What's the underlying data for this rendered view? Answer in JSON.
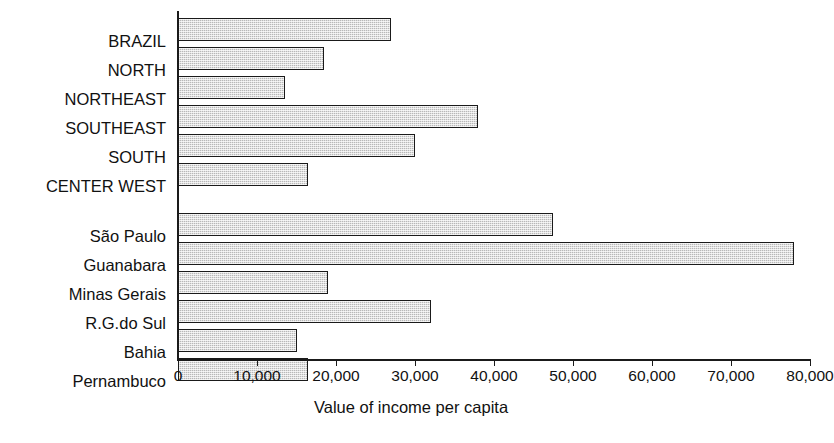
{
  "chart_data": {
    "type": "bar",
    "orientation": "horizontal",
    "title": "",
    "xlabel": "Value of income per capita",
    "ylabel": "",
    "xlim": [
      0,
      80000
    ],
    "grid": false,
    "legend": null,
    "xticks": [
      0,
      10000,
      20000,
      30000,
      40000,
      50000,
      60000,
      70000,
      80000
    ],
    "xticklabels": [
      "0",
      "10,000",
      "20,000",
      "30,000",
      "40,000",
      "50,000",
      "60,000",
      "70,000",
      "80,000"
    ],
    "groups": [
      {
        "name": "regions",
        "categories": [
          "BRAZIL",
          "NORTH",
          "NORTHEAST",
          "SOUTHEAST",
          "SOUTH",
          "CENTER WEST"
        ],
        "values": [
          27000,
          18500,
          13500,
          38000,
          30000,
          16500
        ]
      },
      {
        "name": "states",
        "categories": [
          "São Paulo",
          "Guanabara",
          "Minas Gerais",
          "R.G.do Sul",
          "Bahia",
          "Pernambuco"
        ],
        "values": [
          47500,
          78000,
          19000,
          32000,
          15000,
          16500
        ]
      }
    ],
    "categories": [
      "BRAZIL",
      "NORTH",
      "NORTHEAST",
      "SOUTHEAST",
      "SOUTH",
      "CENTER WEST",
      "São Paulo",
      "Guanabara",
      "Minas Gerais",
      "R.G.do Sul",
      "Bahia",
      "Pernambuco"
    ],
    "values": [
      27000,
      18500,
      13500,
      38000,
      30000,
      16500,
      47500,
      78000,
      19000,
      32000,
      15000,
      16500
    ],
    "bar_color": "#b8b8b8",
    "bar_edge_color": "#1a1a1a",
    "axis_color": "#1a1a1a"
  }
}
